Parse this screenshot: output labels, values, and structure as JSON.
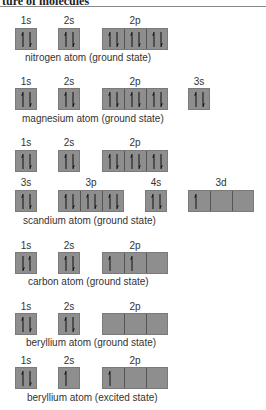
{
  "header": {
    "title": "ture of molecules"
  },
  "colors": {
    "box_fill": "#8e8e8e",
    "box_border": "#7a7a7a",
    "arrow": "#111111"
  },
  "diagrams": [
    {
      "caption": "nitrogen atom (ground state)",
      "rows": [
        {
          "orbitals": [
            {
              "label": "1s",
              "cells": [
                [
                  "up",
                  "down"
                ]
              ]
            },
            {
              "label": "2s",
              "cells": [
                [
                  "up",
                  "down"
                ]
              ]
            },
            {
              "label": "2p",
              "cells": [
                [
                  "up",
                  "down"
                ],
                [
                  "up",
                  "down"
                ],
                [
                  "up",
                  "down"
                ]
              ]
            }
          ]
        }
      ]
    },
    {
      "caption": "magnesium atom (ground state)",
      "rows": [
        {
          "orbitals": [
            {
              "label": "1s",
              "cells": [
                [
                  "up",
                  "down"
                ]
              ]
            },
            {
              "label": "2s",
              "cells": [
                [
                  "up",
                  "down"
                ]
              ]
            },
            {
              "label": "2p",
              "cells": [
                [
                  "up",
                  "down"
                ],
                [
                  "up",
                  "down"
                ],
                [
                  "up",
                  "down"
                ]
              ]
            },
            {
              "label": "3s",
              "cells": [
                [
                  "up",
                  "down"
                ]
              ]
            }
          ]
        }
      ]
    },
    {
      "caption": "scandium atom (ground state)",
      "rows": [
        {
          "orbitals": [
            {
              "label": "1s",
              "cells": [
                [
                  "up",
                  "down"
                ]
              ]
            },
            {
              "label": "2s",
              "cells": [
                [
                  "up",
                  "down"
                ]
              ]
            },
            {
              "label": "2p",
              "cells": [
                [
                  "up",
                  "down"
                ],
                [
                  "up",
                  "down"
                ],
                [
                  "up",
                  "down"
                ]
              ]
            }
          ]
        },
        {
          "orbitals": [
            {
              "label": "3s",
              "cells": [
                [
                  "up",
                  "down"
                ]
              ]
            },
            {
              "label": "3p",
              "cells": [
                [
                  "up",
                  "down"
                ],
                [
                  "up",
                  "down"
                ],
                [
                  "up",
                  "down"
                ]
              ]
            },
            {
              "label": "4s",
              "cells": [
                [
                  "up",
                  "down"
                ]
              ]
            },
            {
              "label": "3d",
              "cells": [
                [
                  "up"
                ],
                [],
                []
              ]
            }
          ]
        }
      ]
    },
    {
      "caption": "carbon atom (ground state)",
      "rows": [
        {
          "orbitals": [
            {
              "label": "1s",
              "cells": [
                [
                  "down",
                  "up"
                ]
              ]
            },
            {
              "label": "2s",
              "cells": [
                [
                  "up",
                  "down"
                ]
              ]
            },
            {
              "label": "2p",
              "cells": [
                [
                  "up"
                ],
                [
                  "up"
                ],
                []
              ]
            }
          ]
        }
      ]
    },
    {
      "caption": "beryllium atom (ground state)",
      "rows": [
        {
          "orbitals": [
            {
              "label": "1s",
              "cells": [
                [
                  "up",
                  "down"
                ]
              ]
            },
            {
              "label": "2s",
              "cells": [
                [
                  "up",
                  "down"
                ]
              ]
            },
            {
              "label": "2p",
              "cells": [
                [],
                [],
                []
              ]
            }
          ]
        }
      ]
    },
    {
      "caption": "beryllium atom (excited state)",
      "rows": [
        {
          "orbitals": [
            {
              "label": "1s",
              "cells": [
                [
                  "up",
                  "down"
                ]
              ]
            },
            {
              "label": "2s",
              "cells": [
                [
                  "up"
                ]
              ]
            },
            {
              "label": "2p",
              "cells": [
                [
                  "up"
                ],
                [],
                []
              ]
            }
          ]
        }
      ]
    }
  ]
}
